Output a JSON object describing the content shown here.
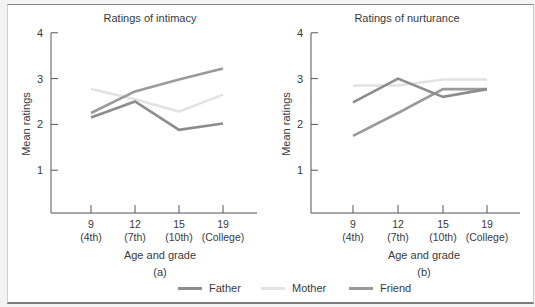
{
  "chart_data": [
    {
      "type": "line",
      "title": "Ratings of intimacy",
      "panel_label": "(a)",
      "xlabel": "Age and grade",
      "ylabel": "Mean ratings",
      "ylim": [
        0,
        4
      ],
      "yticks": [
        1,
        2,
        3,
        4
      ],
      "categories": [
        "9 (4th)",
        "12 (7th)",
        "15 (10th)",
        "19 (College)"
      ],
      "x_tick_top": [
        "9",
        "12",
        "15",
        "19"
      ],
      "x_tick_bottom": [
        "(4th)",
        "(7th)",
        "(10th)",
        "(College)"
      ],
      "series": [
        {
          "name": "Father",
          "values": [
            2.15,
            2.5,
            1.88,
            2.02
          ]
        },
        {
          "name": "Mother",
          "values": [
            2.77,
            2.55,
            2.28,
            2.65
          ]
        },
        {
          "name": "Friend",
          "values": [
            2.25,
            2.72,
            2.98,
            3.22
          ]
        }
      ],
      "grid": false
    },
    {
      "type": "line",
      "title": "Ratings of nurturance",
      "panel_label": "(b)",
      "xlabel": "Age and grade",
      "ylabel": "Mean ratings",
      "ylim": [
        0,
        4
      ],
      "yticks": [
        1,
        2,
        3,
        4
      ],
      "categories": [
        "9 (4th)",
        "12 (7th)",
        "15 (10th)",
        "19 (College)"
      ],
      "x_tick_top": [
        "9",
        "12",
        "15",
        "19"
      ],
      "x_tick_bottom": [
        "(4th)",
        "(7th)",
        "(10th)",
        "(College)"
      ],
      "series": [
        {
          "name": "Father",
          "values": [
            2.48,
            3.0,
            2.6,
            2.77
          ]
        },
        {
          "name": "Mother",
          "values": [
            2.85,
            2.85,
            2.98,
            2.98
          ]
        },
        {
          "name": "Friend",
          "values": [
            1.75,
            2.25,
            2.77,
            2.77
          ]
        }
      ],
      "grid": false
    }
  ],
  "legend": {
    "position": "bottom",
    "items": [
      {
        "name": "Father",
        "color": "#8c8c8c"
      },
      {
        "name": "Mother",
        "color": "#e2e2e2"
      },
      {
        "name": "Friend",
        "color": "#9a9a9a"
      }
    ]
  }
}
